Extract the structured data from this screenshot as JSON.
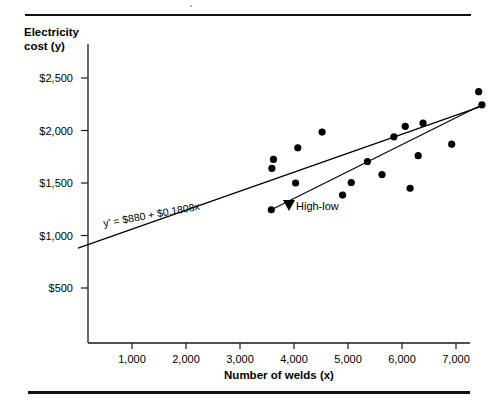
{
  "figure": {
    "rules": {
      "top": "horizontal-rule",
      "bottom": "horizontal-rule"
    }
  },
  "chart_data": {
    "type": "scatter",
    "title": "",
    "xlabel": "Number of welds (x)",
    "ylabel": "Electricity cost (y)",
    "ylabel_line1": "Electricity",
    "ylabel_line2": "cost (y)",
    "xlim": [
      0,
      7800
    ],
    "ylim": [
      0,
      2700
    ],
    "grid": false,
    "legend": "none",
    "xticks": [
      1000,
      2000,
      3000,
      4000,
      5000,
      6000,
      7000
    ],
    "xtick_labels": [
      "1,000",
      "2,000",
      "3,000",
      "4,000",
      "5,000",
      "6,000",
      "7,000"
    ],
    "yticks": [
      500,
      1000,
      1500,
      2000,
      2500
    ],
    "ytick_labels": [
      "$500",
      "$1,000",
      "$1,500",
      "$2,000",
      "$2,500"
    ],
    "points": [
      {
        "x": 3580,
        "y": 1245
      },
      {
        "x": 3590,
        "y": 1640
      },
      {
        "x": 3620,
        "y": 1725
      },
      {
        "x": 4030,
        "y": 1500
      },
      {
        "x": 4070,
        "y": 1835
      },
      {
        "x": 4520,
        "y": 1985
      },
      {
        "x": 4900,
        "y": 1385
      },
      {
        "x": 5060,
        "y": 1505
      },
      {
        "x": 5360,
        "y": 1705
      },
      {
        "x": 5630,
        "y": 1580
      },
      {
        "x": 5850,
        "y": 1940
      },
      {
        "x": 6060,
        "y": 2040
      },
      {
        "x": 6150,
        "y": 1450
      },
      {
        "x": 6300,
        "y": 1760
      },
      {
        "x": 6390,
        "y": 2070
      },
      {
        "x": 6920,
        "y": 1870
      },
      {
        "x": 7420,
        "y": 2370
      },
      {
        "x": 7480,
        "y": 2245
      }
    ],
    "regression": {
      "name": "least-squares-line",
      "label": "y'  =  $880  +  $0.1808x",
      "intercept": 880,
      "slope": 0.1808,
      "x_start": 0,
      "x_end": 7480
    },
    "high_low": {
      "name": "high-low-line",
      "label": "High-low",
      "x_start": 3580,
      "y_start": 1245,
      "x_end": 7480,
      "y_end": 2245
    }
  }
}
